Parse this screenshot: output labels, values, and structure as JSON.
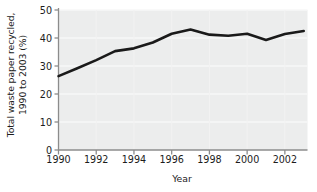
{
  "chart_data": {
    "type": "line",
    "title": "",
    "subtitle": "",
    "xlabel": "Year",
    "ylabel": "Total waste paper recycled,\n1990 to 2003 (%)",
    "x": [
      1990,
      1991,
      1992,
      1993,
      1994,
      1995,
      1996,
      1997,
      1998,
      1999,
      2000,
      2001,
      2002,
      2003
    ],
    "values": [
      26.4,
      29.2,
      32.1,
      35.3,
      36.3,
      38.4,
      41.5,
      43.0,
      41.2,
      40.8,
      41.5,
      39.3,
      41.4,
      42.5
    ],
    "series": [
      {
        "name": "Total waste paper recycled",
        "values": [
          26.4,
          29.2,
          32.1,
          35.3,
          36.3,
          38.4,
          41.5,
          43.0,
          41.2,
          40.8,
          41.5,
          39.3,
          41.4,
          42.5
        ]
      }
    ],
    "xlim": [
      1990,
      2003.2
    ],
    "ylim": [
      0,
      50
    ],
    "ytick_labels": [
      "0",
      "10",
      "20",
      "30",
      "40",
      "50"
    ],
    "yticks": [
      0,
      10,
      20,
      30,
      40,
      50
    ],
    "xtick_labels": [
      "1990",
      "1992",
      "1994",
      "1996",
      "1998",
      "2000",
      "2002"
    ],
    "xticks": [
      1990,
      1992,
      1994,
      1996,
      1998,
      2000,
      2002
    ],
    "grid": "horizontal-faint",
    "legend": "none",
    "line_color": "#1a1a1a",
    "plot_background": "#eceded",
    "figure_background": "#ffffff",
    "axis_color": "#8c8c8c"
  }
}
